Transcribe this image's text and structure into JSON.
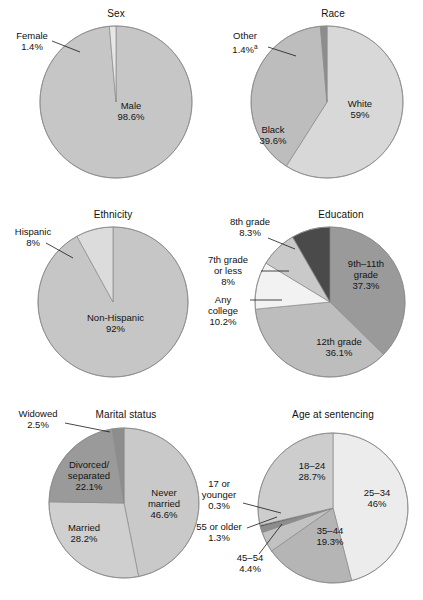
{
  "figure": {
    "width": 423,
    "height": 600,
    "background": "#ffffff"
  },
  "palette": {
    "g1": "#f2f2f2",
    "g2": "#e3e3e3",
    "g3": "#d2d2d2",
    "g4": "#c6c6c6",
    "g5": "#bdbdbd",
    "g6": "#ababab",
    "g7": "#9a9a9a",
    "g8": "#8d8d8d",
    "g9": "#6f6f6f",
    "g10": "#4a4a4a",
    "g11": "#333333",
    "outline": "#8a8a8a"
  },
  "chart_data": [
    {
      "type": "pie",
      "title": "Sex",
      "categories": [
        "Male",
        "Female"
      ],
      "values": [
        98.6,
        1.4
      ],
      "labels": [
        "Male\n98.6%",
        "Female\n1.4%"
      ],
      "segments": [
        {
          "name": "Male",
          "label": "Male",
          "value": "98.6%",
          "color": "#c6c6c6",
          "placement": "inside"
        },
        {
          "name": "Female",
          "label": "Female",
          "value": "1.4%",
          "color": "#e3e3e3",
          "placement": "outside"
        }
      ],
      "start_angle": 0,
      "units": "percent"
    },
    {
      "type": "pie",
      "title": "Race",
      "categories": [
        "White",
        "Black",
        "Other"
      ],
      "values": [
        59.0,
        39.6,
        1.4
      ],
      "segments": [
        {
          "name": "White",
          "label": "White",
          "value": "59%",
          "color": "#d8d8d8",
          "placement": "inside"
        },
        {
          "name": "Black",
          "label": "Black",
          "value": "39.6%",
          "color": "#bdbdbd",
          "placement": "inside"
        },
        {
          "name": "Other",
          "label": "Other",
          "value": "1.4%",
          "footnote": "a",
          "color": "#8d8d8d",
          "placement": "outside"
        }
      ],
      "start_angle": 0,
      "units": "percent"
    },
    {
      "type": "pie",
      "title": "Ethnicity",
      "categories": [
        "Non-Hispanic",
        "Hispanic"
      ],
      "values": [
        92.0,
        8.0
      ],
      "segments": [
        {
          "name": "Non-Hispanic",
          "label": "Non-Hispanic",
          "value": "92%",
          "color": "#c6c6c6",
          "placement": "inside"
        },
        {
          "name": "Hispanic",
          "label": "Hispanic",
          "value": "8%",
          "color": "#dcdcdc",
          "placement": "outside"
        }
      ],
      "start_angle": 0,
      "units": "percent"
    },
    {
      "type": "pie",
      "title": "Education",
      "categories": [
        "9th-11th grade",
        "12th grade",
        "Any college",
        "7th grade or less",
        "8th grade"
      ],
      "values": [
        37.3,
        36.1,
        10.2,
        8.0,
        8.3
      ],
      "segments": [
        {
          "name": "9th-11th grade",
          "label": "9th–11th\ngrade",
          "value": "37.3%",
          "color": "#9a9a9a",
          "placement": "inside"
        },
        {
          "name": "12th grade",
          "label": "12th grade",
          "value": "36.1%",
          "color": "#bdbdbd",
          "placement": "inside"
        },
        {
          "name": "Any college",
          "label": "Any\ncollege",
          "value": "10.2%",
          "color": "#f2f2f2",
          "placement": "outside"
        },
        {
          "name": "7th grade or less",
          "label": "7th grade\nor less",
          "value": "8%",
          "color": "#c9c9c9",
          "placement": "outside"
        },
        {
          "name": "8th grade",
          "label": "8th grade",
          "value": "8.3%",
          "color": "#4a4a4a",
          "placement": "outside"
        }
      ],
      "start_angle": 0,
      "units": "percent"
    },
    {
      "type": "pie",
      "title": "Marital status",
      "categories": [
        "Never married",
        "Married",
        "Divorced/separated",
        "Widowed"
      ],
      "values": [
        46.6,
        28.2,
        22.1,
        2.5
      ],
      "segments": [
        {
          "name": "Never married",
          "label": "Never\nmarried",
          "value": "46.6%",
          "color": "#c9c9c9",
          "placement": "inside"
        },
        {
          "name": "Married",
          "label": "Married",
          "value": "28.2%",
          "color": "#cfcfcf",
          "placement": "inside"
        },
        {
          "name": "Divorced/separated",
          "label": "Divorced/\nseparated",
          "value": "22.1%",
          "color": "#9a9a9a",
          "placement": "inside"
        },
        {
          "name": "Widowed",
          "label": "Widowed",
          "value": "2.5%",
          "color": "#8d8d8d",
          "placement": "outside"
        }
      ],
      "start_angle": 0,
      "units": "percent"
    },
    {
      "type": "pie",
      "title": "Age at sentencing",
      "categories": [
        "25-34",
        "35-44",
        "45-54",
        "55 or older",
        "17 or younger",
        "18-24"
      ],
      "values": [
        46.0,
        19.3,
        4.4,
        1.3,
        0.3,
        28.7
      ],
      "segments": [
        {
          "name": "25-34",
          "label": "25–34",
          "value": "46%",
          "color": "#ececec",
          "placement": "inside"
        },
        {
          "name": "35-44",
          "label": "35–44",
          "value": "19.3%",
          "color": "#b5b5b5",
          "placement": "inside"
        },
        {
          "name": "45-54",
          "label": "45–54",
          "value": "4.4%",
          "color": "#c2c2c2",
          "placement": "outside"
        },
        {
          "name": "55 or older",
          "label": "55 or older",
          "value": "1.3%",
          "color": "#8d8d8d",
          "placement": "outside"
        },
        {
          "name": "17 or younger",
          "label": "17 or\nyounger",
          "value": "0.3%",
          "color": "#333333",
          "placement": "outside"
        },
        {
          "name": "18-24",
          "label": "18–24",
          "value": "28.7%",
          "color": "#cdcdcd",
          "placement": "inside"
        }
      ],
      "start_angle": 0,
      "units": "percent"
    }
  ],
  "charts": {
    "sex": {
      "title": "Sex",
      "male_label": "Male",
      "male_value": "98.6%",
      "female_label": "Female",
      "female_value": "1.4%"
    },
    "race": {
      "title": "Race",
      "white_label": "White",
      "white_value": "59%",
      "black_label": "Black",
      "black_value": "39.6%",
      "other_label": "Other",
      "other_value": "1.4%",
      "other_footnote": "a"
    },
    "ethnicity": {
      "title": "Ethnicity",
      "non_hispanic_label": "Non-Hispanic",
      "non_hispanic_value": "92%",
      "hispanic_label": "Hispanic",
      "hispanic_value": "8%"
    },
    "education": {
      "title": "Education",
      "ninth_label_line1": "9th–11th",
      "ninth_label_line2": "grade",
      "ninth_value": "37.3%",
      "twelfth_label": "12th grade",
      "twelfth_value": "36.1%",
      "college_label_line1": "Any",
      "college_label_line2": "college",
      "college_value": "10.2%",
      "seventh_label_line1": "7th grade",
      "seventh_label_line2": "or less",
      "seventh_value": "8%",
      "eighth_label": "8th grade",
      "eighth_value": "8.3%"
    },
    "marital": {
      "title": "Marital status",
      "never_label_line1": "Never",
      "never_label_line2": "married",
      "never_value": "46.6%",
      "married_label": "Married",
      "married_value": "28.2%",
      "divorced_label_line1": "Divorced/",
      "divorced_label_line2": "separated",
      "divorced_value": "22.1%",
      "widowed_label": "Widowed",
      "widowed_value": "2.5%"
    },
    "age": {
      "title": "Age at sentencing",
      "a25_label": "25–34",
      "a25_value": "46%",
      "a18_label": "18–24",
      "a18_value": "28.7%",
      "a35_label": "35–44",
      "a35_value": "19.3%",
      "a45_label": "45–54",
      "a45_value": "4.4%",
      "a55_label": "55 or older",
      "a55_value": "1.3%",
      "a17_label_line1": "17 or",
      "a17_label_line2": "younger",
      "a17_value": "0.3%"
    }
  }
}
